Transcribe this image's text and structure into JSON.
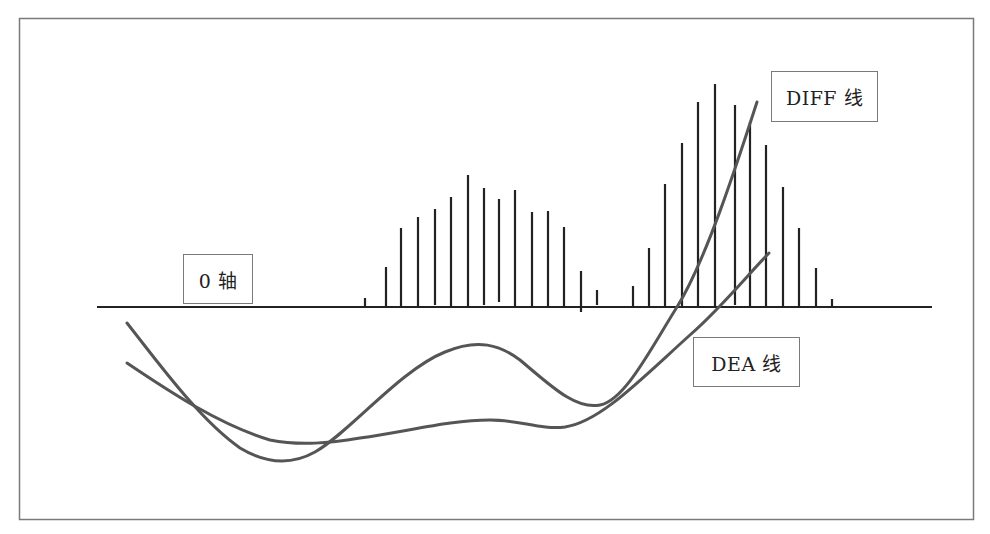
{
  "diagram": {
    "type": "MACD indicator illustration",
    "frame_color": "#7a7a7a",
    "bar_color": "#222222",
    "line_color": "#555555"
  },
  "labels": {
    "zero_axis": {
      "text": "0 轴",
      "box": [
        183,
        254,
        70,
        50
      ]
    },
    "diff_line": {
      "text": "DIFF 线",
      "box": [
        771,
        71,
        107,
        51
      ]
    },
    "dea_line": {
      "text": "DEA 线",
      "box": [
        693,
        337,
        107,
        50
      ]
    }
  },
  "chart_data": {
    "type": "bar+line",
    "title": "",
    "zero_axis": {
      "y": 307,
      "x_start": 97,
      "x_end": 932,
      "label": "0 轴"
    },
    "histogram": {
      "cluster_1": [
        {
          "x": 365,
          "top": 298,
          "bottom": 307
        },
        {
          "x": 386,
          "top": 267,
          "bottom": 307
        },
        {
          "x": 401,
          "top": 228,
          "bottom": 307
        },
        {
          "x": 418,
          "top": 217,
          "bottom": 306
        },
        {
          "x": 435,
          "top": 209,
          "bottom": 305
        },
        {
          "x": 451,
          "top": 197,
          "bottom": 307
        },
        {
          "x": 468,
          "top": 175,
          "bottom": 307
        },
        {
          "x": 484,
          "top": 188,
          "bottom": 305
        },
        {
          "x": 499,
          "top": 199,
          "bottom": 302
        },
        {
          "x": 515,
          "top": 190,
          "bottom": 307
        },
        {
          "x": 532,
          "top": 212,
          "bottom": 307
        },
        {
          "x": 548,
          "top": 211,
          "bottom": 307
        },
        {
          "x": 564,
          "top": 227,
          "bottom": 307
        },
        {
          "x": 581,
          "top": 271,
          "bottom": 312
        },
        {
          "x": 597,
          "top": 290,
          "bottom": 305
        }
      ],
      "cluster_2": [
        {
          "x": 633,
          "top": 286,
          "bottom": 307
        },
        {
          "x": 649,
          "top": 248,
          "bottom": 307
        },
        {
          "x": 665,
          "top": 184,
          "bottom": 307
        },
        {
          "x": 682,
          "top": 143,
          "bottom": 307
        },
        {
          "x": 698,
          "top": 102,
          "bottom": 307
        },
        {
          "x": 715,
          "top": 84,
          "bottom": 307
        },
        {
          "x": 735,
          "top": 105,
          "bottom": 305
        },
        {
          "x": 750,
          "top": 122,
          "bottom": 307
        },
        {
          "x": 766,
          "top": 145,
          "bottom": 307
        },
        {
          "x": 783,
          "top": 187,
          "bottom": 307
        },
        {
          "x": 799,
          "top": 228,
          "bottom": 307
        },
        {
          "x": 816,
          "top": 268,
          "bottom": 307
        },
        {
          "x": 832,
          "top": 299,
          "bottom": 307
        }
      ]
    },
    "series": [
      {
        "name": "DIFF 线",
        "path": "M127,323 C160,365 200,420 240,448 C265,463 290,466 315,452 C350,432 400,370 445,352 C478,338 500,345 520,360 C550,385 575,410 600,405 C625,400 650,350 677,307 C705,262 735,170 757,102"
      },
      {
        "name": "DEA 线",
        "path": "M127,363 C170,392 220,425 270,440 C300,446 330,443 360,438 C410,431 450,420 490,420 C520,420 540,430 565,427 C600,422 640,380 690,335 C720,309 745,278 769,253"
      }
    ]
  }
}
